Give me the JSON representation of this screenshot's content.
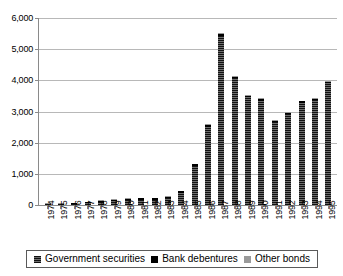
{
  "chart_data": {
    "type": "bar",
    "stacked": true,
    "title": "",
    "subtitle": "",
    "xlabel": "",
    "ylabel": "",
    "ylim": [
      0,
      6000
    ],
    "yticks": [
      0,
      1000,
      2000,
      3000,
      4000,
      5000,
      6000
    ],
    "ytick_labels": [
      "0",
      "1,000",
      "2,000",
      "3,000",
      "4,000",
      "5,000",
      "6,000"
    ],
    "grid": true,
    "legend_position": "bottom",
    "categories": [
      "1974",
      "1975",
      "1976",
      "1977",
      "1978",
      "1979",
      "1980",
      "1981",
      "1982",
      "1983",
      "1984",
      "1985",
      "1986",
      "1987",
      "1988",
      "1989",
      "1990",
      "1991",
      "1992",
      "1993",
      "1994",
      "1995"
    ],
    "series": [
      {
        "name": "Government securities",
        "color": "#2b2b2b",
        "values": [
          12,
          18,
          30,
          70,
          110,
          120,
          155,
          165,
          170,
          210,
          380,
          1250,
          2500,
          5420,
          4060,
          3450,
          3350,
          2660,
          2920,
          3280,
          3360,
          3900
        ]
      },
      {
        "name": "Bank debentures",
        "color": "#000000",
        "values": [
          6,
          8,
          14,
          20,
          35,
          45,
          50,
          45,
          45,
          55,
          55,
          55,
          60,
          60,
          55,
          50,
          50,
          45,
          45,
          45,
          45,
          40
        ]
      },
      {
        "name": "Other bonds",
        "color": "#9a9a9a",
        "values": [
          2,
          4,
          6,
          10,
          15,
          15,
          20,
          20,
          20,
          25,
          25,
          25,
          30,
          30,
          30,
          30,
          25,
          25,
          25,
          25,
          25,
          25
        ]
      }
    ],
    "totals": [
      20,
      30,
      50,
      100,
      160,
      180,
      225,
      230,
      235,
      290,
      460,
      1330,
      2590,
      5510,
      4145,
      3530,
      3425,
      2730,
      2990,
      3350,
      3430,
      3965
    ]
  },
  "legend": {
    "items": [
      {
        "label": "Government securities",
        "swatch": "swatch-government-securities"
      },
      {
        "label": "Bank debentures",
        "swatch": "swatch-bank-debentures"
      },
      {
        "label": "Other bonds",
        "swatch": "swatch-other-bonds"
      }
    ]
  },
  "colors": {
    "government_securities": "#2b2b2b",
    "bank_debentures": "#000000",
    "other_bonds": "#9a9a9a",
    "gridline": "#b8b8b8",
    "axis": "#8a8a8a",
    "background": "#ffffff"
  }
}
